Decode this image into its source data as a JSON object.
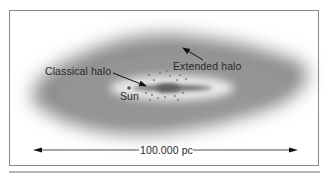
{
  "figure": {
    "labels": {
      "classical_halo": "Classical halo",
      "extended_halo": "Extended halo",
      "sun": "Sun",
      "scale": "100.000 pc"
    },
    "colors": {
      "halo": "#8c8c8c",
      "disk": "#6e6e6e",
      "frame": "#8a8a8a",
      "text": "#2a2a2a"
    }
  }
}
